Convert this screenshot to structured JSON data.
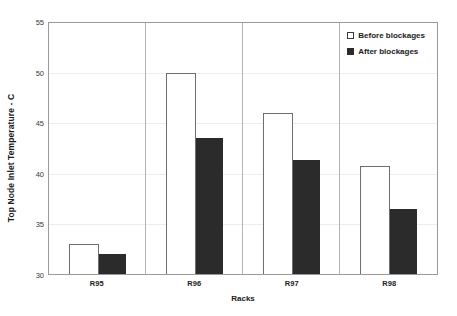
{
  "chart_data": {
    "type": "bar",
    "title": "",
    "xlabel": "Racks",
    "ylabel": "Top Node Inlet Temperature - C",
    "categories": [
      "R95",
      "R96",
      "R97",
      "R98"
    ],
    "ylim": [
      30,
      55
    ],
    "yticks": [
      30,
      35,
      40,
      45,
      50,
      55
    ],
    "grid": true,
    "legend_position": "top-right-inside",
    "series": [
      {
        "name": "Before blockages",
        "swatch": "hollow-square",
        "color": "#ffffff",
        "edge_color": "#6e6e6e",
        "values": [
          33.0,
          50.0,
          46.0,
          40.8
        ]
      },
      {
        "name": "After blockages",
        "swatch": "filled-square",
        "color": "#2b2b2b",
        "edge_color": "#2b2b2b",
        "values": [
          32.0,
          43.5,
          41.4,
          36.5
        ]
      }
    ]
  },
  "axes": {
    "y_title": "Top Node Inlet Temperature - C",
    "x_title": "Racks",
    "y_tick_labels": [
      "30",
      "35",
      "40",
      "45",
      "50",
      "55"
    ],
    "x_tick_labels": [
      "R95",
      "R96",
      "R97",
      "R98"
    ]
  },
  "legend": {
    "items": [
      {
        "label": "Before blockages"
      },
      {
        "label": "After blockages"
      }
    ]
  }
}
